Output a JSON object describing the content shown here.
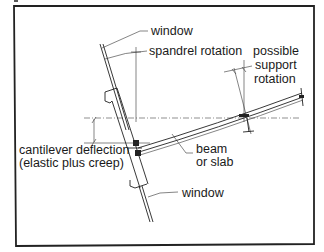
{
  "figure": {
    "type": "structural detail sketch"
  },
  "labels": {
    "window_top": "window",
    "spandrel_rotation": "spandrel rotation",
    "support_rotation": [
      "possible",
      "support",
      "rotation"
    ],
    "cantilever_deflection": [
      "cantilever deflection",
      "(elastic plus creep)"
    ],
    "beam_or_slab": [
      "beam",
      "or slab"
    ],
    "window_bottom": "window"
  },
  "colors": {
    "line": "#222222",
    "background": "#ffffff"
  }
}
